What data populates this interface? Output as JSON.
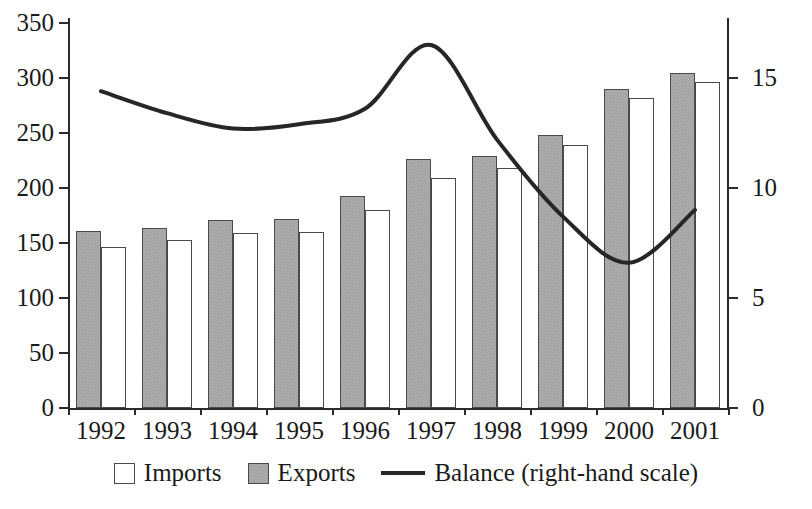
{
  "chart_data": {
    "type": "bar",
    "title": "",
    "subtitle": "",
    "xlabel": "",
    "ylabel": "",
    "categories": [
      "1992",
      "1993",
      "1994",
      "1995",
      "1996",
      "1997",
      "1998",
      "1999",
      "2000",
      "2001"
    ],
    "series": [
      {
        "name": "Exports",
        "axis": "left",
        "type": "bar",
        "color": "#b0b0b0",
        "values": [
          161,
          164,
          171,
          172,
          193,
          226,
          229,
          248,
          290,
          305
        ]
      },
      {
        "name": "Imports",
        "axis": "left",
        "type": "bar",
        "color": "#ffffff",
        "values": [
          146,
          153,
          159,
          160,
          180,
          209,
          218,
          239,
          282,
          296
        ]
      },
      {
        "name": "Balance (right-hand scale)",
        "axis": "right",
        "type": "line",
        "color": "#262626",
        "values": [
          14.4,
          13.4,
          12.7,
          12.9,
          13.6,
          16.5,
          12.2,
          8.7,
          6.6,
          9.0
        ]
      }
    ],
    "ylim": [
      0,
      350
    ],
    "yticks": [
      0,
      50,
      100,
      150,
      200,
      250,
      300,
      350
    ],
    "ylim_right": [
      0,
      17.5
    ],
    "yticks_right": [
      0,
      5,
      10,
      15
    ],
    "grid": false,
    "legend_position": "bottom",
    "legend": [
      {
        "label": "Imports",
        "marker": "square-white"
      },
      {
        "label": "Exports",
        "marker": "square-gray"
      },
      {
        "label": "Balance (right-hand scale)",
        "marker": "line"
      }
    ]
  },
  "axes": {
    "left_tick_labels": [
      "350",
      "300",
      "250",
      "200",
      "150",
      "100",
      "50",
      "0"
    ],
    "right_tick_labels": [
      "15",
      "10",
      "5",
      "0"
    ],
    "x_tick_labels": [
      "1992",
      "1993",
      "1994",
      "1995",
      "1996",
      "1997",
      "1998",
      "1999",
      "2000",
      "2001"
    ]
  }
}
